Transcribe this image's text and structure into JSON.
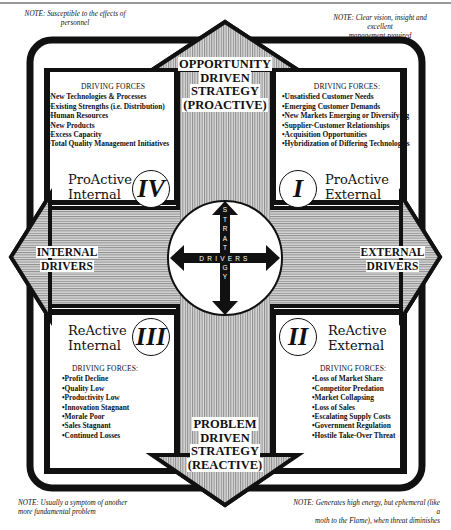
{
  "notes": {
    "top_left": [
      "NOTE: Susceptible to the effects of",
      "personnel"
    ],
    "top_right": [
      "NOTE: Clear vision, insight and excellent",
      "management required"
    ],
    "bottom_left": [
      "NOTE: Usually a symptom of another",
      "more fundamental problem"
    ],
    "bottom_right": [
      "NOTE: Generates high energy, but ephemeral (like a",
      "moth to the Flame), when threat diminishes"
    ]
  },
  "arrows": {
    "top": [
      "OPPORTUNITY",
      "DRIVEN",
      "STRATEGY",
      "(PROACTIVE)"
    ],
    "bottom": [
      "PROBLEM",
      "DRIVEN",
      "STRATEGY",
      "(REACTIVE)"
    ],
    "left": [
      "INTERNAL",
      "DRIVERS"
    ],
    "right": [
      "EXTERNAL",
      "DRIVERS"
    ]
  },
  "center": {
    "horizontal_label": "DRIVERS",
    "vertical_label": "STRATEGY"
  },
  "quadrants": {
    "I": {
      "numeral": "I",
      "label": [
        "ProActive",
        "External"
      ],
      "forces_header": "DRIVING FORCES:",
      "forces": [
        "Unsatisfied Customer Needs",
        "Emerging Customer Demands",
        "New Markets Emerging or Diversifying",
        "Supplier-Customer Relationships",
        "Acquisition Opportunities",
        "Hybridization of Differing Technologies"
      ]
    },
    "II": {
      "numeral": "II",
      "label": [
        "ReActive",
        "External"
      ],
      "forces_header": "DRIVING FORCES:",
      "forces": [
        "Loss of Market Share",
        "Competitor Predation",
        "Market Collapsing",
        "Loss of Sales",
        "Escalating Supply Costs",
        "Government Regulation",
        "Hostile Take-Over Threat"
      ]
    },
    "III": {
      "numeral": "III",
      "label": [
        "ReActive",
        "Internal"
      ],
      "forces_header": "DRIVING FORCES:",
      "forces": [
        "Profit Decline",
        "Quality Low",
        "Productivity Low",
        "Innovation Stagnant",
        "Morale Poor",
        "Sales Stagnant",
        "Continued Losses"
      ]
    },
    "IV": {
      "numeral": "IV",
      "label": [
        "ProActive",
        "Internal"
      ],
      "forces_header": "DRIVING FORCES",
      "forces": [
        "New Technologies & Processes",
        "Existing Strengths  (i.e. Distribution)",
        "Human Resources",
        "New Products",
        "Excess Capacity",
        "Total Quality Management Initiatives"
      ]
    }
  },
  "colors": {
    "ink": "#111111",
    "hatch_dark": "#8a8a8a",
    "hatch_light": "#d9d9d9",
    "paper": "#ffffff"
  }
}
